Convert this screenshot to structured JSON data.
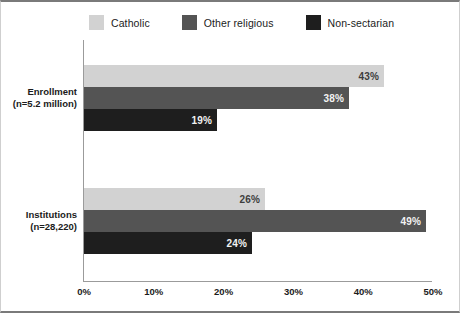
{
  "chart_data": {
    "type": "bar",
    "orientation": "horizontal",
    "title": "",
    "subtitle": "",
    "xlabel": "",
    "ylabel": "",
    "xlim": [
      0,
      50
    ],
    "grid": false,
    "legend_position": "top",
    "categories": [
      "Enrollment\n(n=5.2 million)",
      "Institutions\n(n=28,220)"
    ],
    "category_labels": [
      {
        "line1": "Enrollment",
        "line2": "(n=5.2 million)"
      },
      {
        "line1": "Institutions",
        "line2": "(n=28,220)"
      }
    ],
    "xtick_labels": [
      "0%",
      "10%",
      "20%",
      "30%",
      "40%",
      "50%"
    ],
    "xtick_values": [
      0,
      10,
      20,
      30,
      40,
      50
    ],
    "series": [
      {
        "name": "Catholic",
        "color": "#d2d2d2",
        "label_color": "#3d3d3d",
        "values": [
          43,
          26
        ],
        "value_labels": [
          "43%",
          "26%"
        ]
      },
      {
        "name": "Other religious",
        "color": "#545454",
        "label_color": "#f2f2f2",
        "values": [
          38,
          49
        ],
        "value_labels": [
          "38%",
          "49%"
        ]
      },
      {
        "name": "Non-sectarian",
        "color": "#1e1e1e",
        "label_color": "#f2f2f2",
        "values": [
          19,
          24
        ],
        "value_labels": [
          "19%",
          "24%"
        ]
      }
    ]
  },
  "legend": {
    "items": [
      {
        "label": "Catholic",
        "color": "#d2d2d2"
      },
      {
        "label": "Other religious",
        "color": "#545454"
      },
      {
        "label": "Non-sectarian",
        "color": "#1e1e1e"
      }
    ]
  },
  "colors": {
    "catholic": "#d2d2d2",
    "other_religious": "#545454",
    "non_sectarian": "#1e1e1e",
    "axis": "#9b9b9b",
    "frame": "#7a7a7a",
    "text": "#1b1b1b",
    "background": "#ffffff"
  }
}
